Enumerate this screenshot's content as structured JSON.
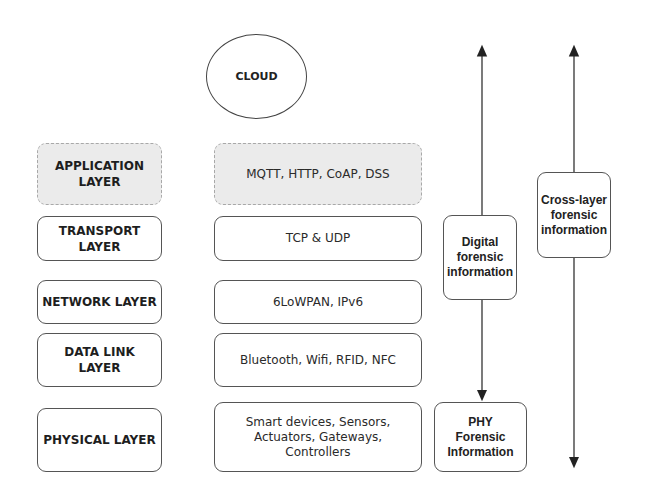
{
  "cloud": {
    "label": "CLOUD"
  },
  "layers": [
    {
      "name": "APPLICATION\nLAYER",
      "protocols": "MQTT, HTTP, CoAP, DSS",
      "highlighted": true
    },
    {
      "name": "TRANSPORT\nLAYER",
      "protocols": "TCP & UDP",
      "highlighted": false
    },
    {
      "name": "NETWORK LAYER",
      "protocols": "6LoWPAN, IPv6",
      "highlighted": false
    },
    {
      "name": "DATA LINK\nLAYER",
      "protocols": "Bluetooth, Wifi, RFID, NFC",
      "highlighted": false
    },
    {
      "name": "PHYSICAL LAYER",
      "protocols": "Smart devices, Sensors,\nActuators, Gateways,\nControllers",
      "highlighted": false
    }
  ],
  "forensics": {
    "digital": "Digital\nforensic\ninformation",
    "phy": "PHY\nForensic\nInformation",
    "cross_layer": "Cross-layer\nforensic\ninformation"
  },
  "colors": {
    "highlight_fill": "#ebebeb",
    "border": "#555555"
  }
}
